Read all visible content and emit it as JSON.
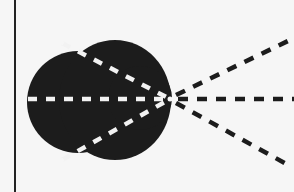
{
  "diagram": {
    "colors": {
      "background": "#f6f6f6",
      "blob": "#1c1c1c",
      "dash_inside": "#f2f2f2",
      "dash_outside": "#1c1c1c",
      "axis_line": "#222222"
    },
    "vertical_line": {
      "x": 15,
      "y1": 0,
      "y2": 192
    },
    "focal_point": {
      "x": 170,
      "y": 99
    },
    "rays": [
      {
        "name": "upper",
        "inner_start": [
          62,
          43
        ],
        "outer_end": [
          288,
          41
        ]
      },
      {
        "name": "middle",
        "inner_start": [
          28,
          99
        ],
        "outer_end": [
          294,
          99
        ]
      },
      {
        "name": "lower",
        "inner_start": [
          62,
          160
        ],
        "outer_end": [
          288,
          165
        ]
      }
    ]
  }
}
